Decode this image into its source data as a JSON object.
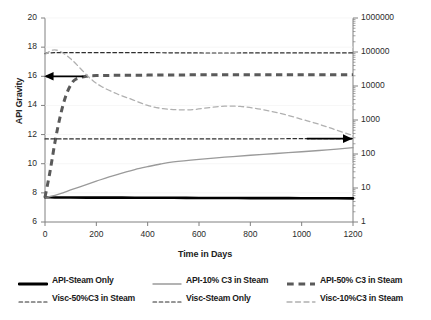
{
  "chart_data": {
    "type": "line",
    "title": "",
    "xlabel": "Time in Days",
    "ylabel": "API Gravity",
    "ylabel_right": "Viscosity at 30°C (cP)",
    "xlim": [
      0,
      1200
    ],
    "xticks": [
      "0",
      "200",
      "400",
      "600",
      "800",
      "1000",
      "1200"
    ],
    "xtick_values": [
      0,
      200,
      400,
      600,
      800,
      1000,
      1200
    ],
    "ylim": [
      6,
      20
    ],
    "yticks": [
      "6",
      "8",
      "10",
      "12",
      "14",
      "16",
      "18",
      "20"
    ],
    "ytick_values": [
      6,
      8,
      10,
      12,
      14,
      16,
      18,
      20
    ],
    "ylim_right": [
      1,
      1000000
    ],
    "yscale_right": "log",
    "yticks_right": [
      "1",
      "10",
      "100",
      "1000",
      "10000",
      "100000",
      "1000000"
    ],
    "ytick_values_right": [
      1,
      10,
      100,
      1000,
      10000,
      100000,
      1000000
    ],
    "grid": false,
    "legend_position": "bottom",
    "annotations": [
      {
        "name": "left-axis-arrow",
        "label": "",
        "points_to": "left-axis",
        "x": 0,
        "y": 16.0
      },
      {
        "name": "right-axis-arrow",
        "label": "",
        "points_to": "right-axis",
        "x": 1200,
        "y": 11.72
      }
    ],
    "series": [
      {
        "name": "API-Steam Only",
        "axis": "left",
        "color": "#000000",
        "style": "solid",
        "width": 2.6,
        "x": [
          0,
          10,
          50,
          100,
          200,
          300,
          400,
          500,
          600,
          700,
          800,
          900,
          1000,
          1100,
          1200
        ],
        "values": [
          7.7,
          7.7,
          7.68,
          7.68,
          7.67,
          7.67,
          7.66,
          7.66,
          7.65,
          7.65,
          7.64,
          7.64,
          7.63,
          7.63,
          7.62
        ]
      },
      {
        "name": "API-10% C3 in Steam",
        "axis": "left",
        "color": "#9a9a9a",
        "style": "solid",
        "width": 1.3,
        "x": [
          0,
          20,
          60,
          100,
          150,
          200,
          250,
          300,
          350,
          400,
          450,
          500,
          600,
          700,
          800,
          900,
          1000,
          1100,
          1200
        ],
        "values": [
          7.7,
          7.75,
          7.95,
          8.2,
          8.5,
          8.8,
          9.1,
          9.35,
          9.6,
          9.8,
          9.98,
          10.12,
          10.3,
          10.45,
          10.58,
          10.7,
          10.82,
          10.95,
          11.1
        ]
      },
      {
        "name": "API-50% C3 in Steam",
        "axis": "left",
        "color": "#5a5a5a",
        "style": "dashed-thick",
        "width": 3.0,
        "x": [
          0,
          20,
          40,
          60,
          80,
          100,
          120,
          160,
          200,
          400,
          600,
          800,
          1000,
          1200
        ],
        "values": [
          7.7,
          9.5,
          11.6,
          13.3,
          14.6,
          15.4,
          15.8,
          16.0,
          16.05,
          16.08,
          16.1,
          16.1,
          16.1,
          16.1
        ]
      },
      {
        "name": "Visc-50%C3 in Steam",
        "axis": "right",
        "color": "#2e2e2e",
        "style": "dashed-fine",
        "width": 1.2,
        "x": [
          0,
          10,
          30,
          60,
          100,
          200,
          400,
          600,
          800,
          1000,
          1200
        ],
        "values": [
          11.7,
          11.7,
          11.7,
          11.7,
          11.7,
          11.7,
          11.7,
          11.7,
          11.7,
          11.72,
          11.72
        ],
        "viscosity_cP": [
          300,
          300,
          300,
          300,
          300,
          300,
          300,
          300,
          300,
          300,
          300
        ]
      },
      {
        "name": "Visc-Steam Only",
        "axis": "right",
        "color": "#2e2e2e",
        "style": "dashed-fine",
        "width": 1.2,
        "x": [
          0,
          10,
          40,
          80,
          120,
          200,
          400,
          600,
          800,
          1000,
          1200
        ],
        "values": [
          17.55,
          17.6,
          17.62,
          17.62,
          17.62,
          17.62,
          17.62,
          17.6,
          17.6,
          17.6,
          17.6
        ],
        "viscosity_cP": [
          90000,
          90000,
          90000,
          90000,
          90000,
          90000,
          90000,
          90000,
          90000,
          90000,
          90000
        ]
      },
      {
        "name": "Visc-10%C3 in Steam",
        "axis": "right",
        "color": "#b0b0b0",
        "style": "dashed-med",
        "width": 1.3,
        "x": [
          0,
          30,
          60,
          100,
          140,
          180,
          220,
          280,
          340,
          400,
          460,
          520,
          580,
          640,
          700,
          760,
          820,
          880,
          940,
          1000,
          1060,
          1120,
          1180,
          1200
        ],
        "values": [
          17.5,
          17.8,
          17.7,
          17.2,
          16.5,
          15.8,
          15.3,
          14.8,
          14.4,
          14.0,
          13.78,
          13.7,
          13.72,
          13.85,
          13.95,
          13.93,
          13.8,
          13.6,
          13.35,
          13.05,
          12.75,
          12.4,
          12.05,
          11.95
        ],
        "viscosity_cP": [
          80000,
          110000,
          100000,
          62000,
          33000,
          19000,
          13500,
          9000,
          6500,
          4600,
          3900,
          3600,
          3700,
          4200,
          4700,
          4600,
          4100,
          3400,
          2800,
          2200,
          1750,
          1350,
          1050,
          980
        ]
      }
    ]
  },
  "legend": {
    "items": [
      {
        "label": "API-Steam Only",
        "color": "#000000",
        "style": "solid",
        "width": 2.8
      },
      {
        "label": "API-10% C3 in Steam",
        "color": "#9a9a9a",
        "style": "solid",
        "width": 1.4
      },
      {
        "label": "API-50% C3 in Steam",
        "color": "#5a5a5a",
        "style": "dashed-thick",
        "width": 3.2
      },
      {
        "label": "Visc-50%C3 in Steam",
        "color": "#2e2e2e",
        "style": "dashed-fine",
        "width": 1.2
      },
      {
        "label": "Visc-Steam Only",
        "color": "#2e2e2e",
        "style": "dashed-fine",
        "width": 1.2
      },
      {
        "label": "Visc-10%C3 in Steam",
        "color": "#b0b0b0",
        "style": "dashed-med",
        "width": 1.3
      }
    ]
  },
  "colors": {
    "axis": "#808080",
    "text": "#222222",
    "background": "#ffffff"
  }
}
